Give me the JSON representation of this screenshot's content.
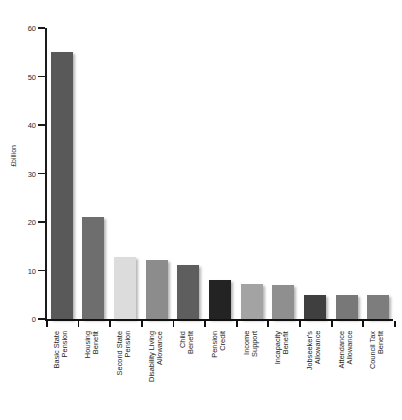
{
  "chart_data": {
    "type": "bar",
    "title": "",
    "subtitle": "",
    "xlabel": "",
    "ylabel": "£billion",
    "ylim": [
      0,
      60
    ],
    "yticks": [
      0,
      10,
      20,
      30,
      40,
      50,
      60
    ],
    "ytick_labels": [
      "0",
      "10",
      "20",
      "30",
      "40",
      "50",
      "60"
    ],
    "grid": false,
    "legend": "none",
    "categories": [
      "Basic State\nPension",
      "Housing\nBenefit",
      "Second State\nPension",
      "Disability Living\nAllowance",
      "Child\nBenefit",
      "Pension\nCredit",
      "Income\nSupport",
      "Incapacity\nBenefit",
      "Jobseeker's\nAllowance",
      "Attendance\nAllowance",
      "Council Tax\nBenefit"
    ],
    "values": [
      55,
      21,
      12.8,
      12.2,
      11.2,
      8,
      7.2,
      7,
      5,
      5,
      5
    ],
    "bar_colors": [
      "#595959",
      "#6e6e6e",
      "#dcdcdc",
      "#8c8c8c",
      "#5e5e5e",
      "#232323",
      "#a3a3a3",
      "#8f8f8f",
      "#3f3f3f",
      "#787878",
      "#7d7d7d"
    ]
  },
  "axis": {
    "y_title": "£billion"
  },
  "footer": {
    "note_marker": "",
    "note_text": ""
  }
}
